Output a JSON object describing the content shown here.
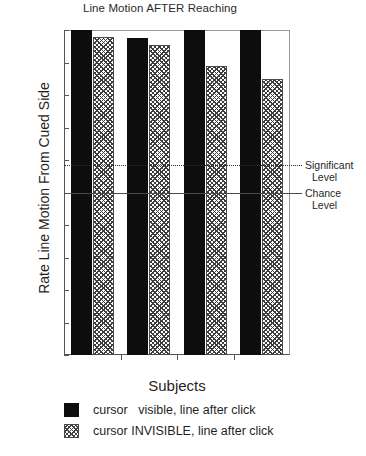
{
  "chart_data": {
    "type": "bar",
    "title": "Line Motion AFTER Reaching",
    "xlabel": "Subjects",
    "ylabel": "Rate Line Motion From Cued Side",
    "categories": [
      "OH",
      "SS",
      "SM",
      "MM"
    ],
    "ylim": [
      0.0,
      1.0
    ],
    "yticks": [
      "0.0",
      "0.1",
      "0.2",
      "0.3",
      "0.4",
      "0.5",
      "0.6",
      "0.7",
      "0.8",
      "0.9",
      "1.0"
    ],
    "ytick_values": [
      0.0,
      0.1,
      0.2,
      0.3,
      0.4,
      0.5,
      0.6,
      0.7,
      0.8,
      0.9,
      1.0
    ],
    "grid": false,
    "legend_position": "below-axes",
    "series": [
      {
        "name": "cursor   visible, line after click",
        "fill": "solid-black",
        "values": [
          1.0,
          0.975,
          1.0,
          1.0
        ]
      },
      {
        "name": "cursor INVISIBLE, line after click",
        "fill": "hatched",
        "values": [
          0.98,
          0.955,
          0.89,
          0.85
        ]
      }
    ],
    "annotations": [
      {
        "id": "significant-level",
        "label_line1": "Significant",
        "label_line2": "Level",
        "value": 0.585,
        "style": "dotted"
      },
      {
        "id": "chance-level",
        "label_line1": "Chance",
        "label_line2": "Level",
        "value": 0.5,
        "style": "solid"
      }
    ],
    "colors": {
      "series_1": "#0d0d0d",
      "series_2_hatch": "#3d3d3d",
      "axis": "#555555",
      "background": "#ffffff"
    }
  }
}
